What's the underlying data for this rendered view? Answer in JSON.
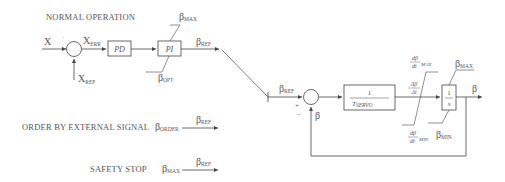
{
  "diagram": {
    "sections": {
      "normal_operation": "NORMAL OPERATION",
      "external_signal": "ORDER BY EXTERNAL SIGNAL",
      "safety_stop": "SAFETY STOP"
    },
    "signals": {
      "x": "X",
      "x_err_main": "X",
      "x_err_sub": "ERR",
      "x_ref_main": "X",
      "x_ref_sub": "REF",
      "beta": "β",
      "beta_max_sub": "MAX",
      "beta_opt_sub": "OPT",
      "beta_ref_sub": "REF",
      "beta_order_sub": "ORDER",
      "beta_min_sub": "MIN"
    },
    "blocks": {
      "pd": "PD",
      "pi": "PI",
      "servo_num": "1",
      "servo_den_main": "T",
      "servo_den_sub": "SERVO",
      "integrator_num": "1",
      "integrator_den": "s"
    },
    "rate_limits": {
      "delta_num": "Δβ",
      "delta_den": "Δt",
      "d_num": "dβ",
      "d_den": "dt",
      "max_sub": "MAX",
      "min_sub": "MIN"
    },
    "summing_signs": {
      "plus": "+",
      "minus": "−"
    }
  }
}
